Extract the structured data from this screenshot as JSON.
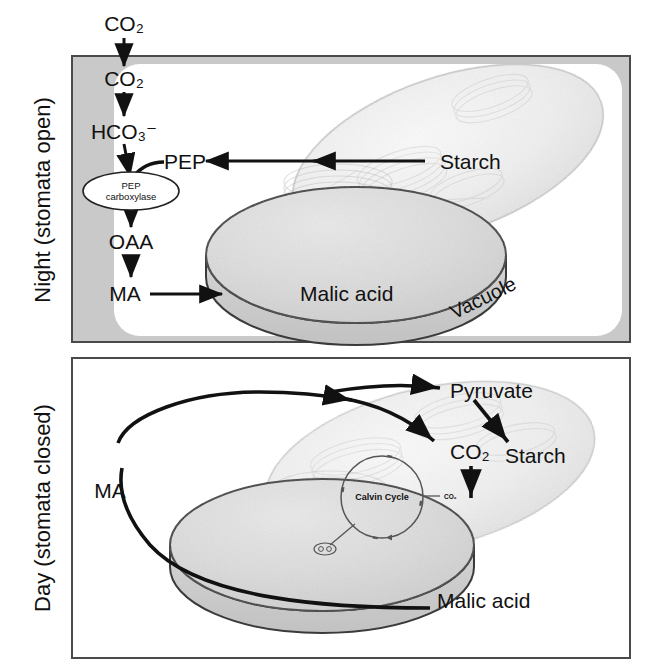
{
  "figure": {
    "title_implicit": "CAM photosynthesis: night and day reactions",
    "colors": {
      "frame_border": "#4a4a4a",
      "night_band": "#c9c9c9",
      "panel_white": "#ffffff",
      "chloroplast_fill": "#ededed",
      "chloroplast_stroke": "#b8b8b8",
      "vacuole_fill": "#d8d8d8",
      "vacuole_stroke": "#3a3a3a",
      "arrow": "#111111",
      "text": "#111111"
    }
  },
  "night_panel": {
    "side_label": "Night (stomata open)",
    "external_label": "CO2",
    "nodes": {
      "co2_outside": "CO₂",
      "co2_inside": "CO₂",
      "bicarbonate": "HCO₃⁻",
      "enzyme_line1": "PEP",
      "enzyme_line2": "carboxylase",
      "pep": "PEP",
      "oaa": "OAA",
      "ma": "MA",
      "malic_acid": "Malic acid",
      "starch": "Starch",
      "vacuole": "Vacuole"
    },
    "arrows": [
      {
        "name": "co2-outside-to-inside",
        "from": "CO₂ (outside)",
        "to": "CO₂ (inside)"
      },
      {
        "name": "co2-to-bicarbonate",
        "from": "CO₂",
        "to": "HCO₃⁻"
      },
      {
        "name": "bicarbonate-to-enzyme",
        "from": "HCO₃⁻",
        "to": "PEP carboxylase"
      },
      {
        "name": "pep-to-enzyme",
        "from": "PEP",
        "to": "PEP carboxylase"
      },
      {
        "name": "enzyme-to-oaa",
        "from": "PEP carboxylase",
        "to": "OAA"
      },
      {
        "name": "oaa-to-ma",
        "from": "OAA",
        "to": "MA"
      },
      {
        "name": "ma-to-malic-acid",
        "from": "MA",
        "to": "Malic acid"
      },
      {
        "name": "starch-to-pep",
        "from": "Starch",
        "to": "PEP"
      }
    ]
  },
  "day_panel": {
    "side_label": "Day (stomata closed)",
    "nodes": {
      "ma": "MA",
      "malic_acid": "Malic acid",
      "pyruvate": "Pyruvate",
      "co2": "CO₂",
      "starch": "Starch",
      "calvin_cycle": "Calvin Cycle",
      "calvin_co2": "CO₂"
    },
    "arrows": [
      {
        "name": "malic-acid-to-ma",
        "from": "Malic acid",
        "to": "MA"
      },
      {
        "name": "ma-to-pyruvate",
        "from": "MA",
        "to": "Pyruvate"
      },
      {
        "name": "ma-to-co2",
        "from": "MA",
        "to": "CO₂"
      },
      {
        "name": "pyruvate-to-starch",
        "from": "Pyruvate",
        "to": "Starch"
      },
      {
        "name": "co2-to-calvin",
        "from": "CO₂",
        "to": "Calvin Cycle"
      }
    ]
  }
}
